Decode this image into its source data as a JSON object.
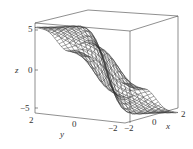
{
  "chart_data": {
    "type": "surface3d",
    "title": "",
    "xlabel": "x",
    "ylabel": "y",
    "zlabel": "z",
    "x_ticks": [
      "-2",
      "0",
      "2"
    ],
    "y_ticks": [
      "2",
      "0",
      "-2"
    ],
    "z_ticks": [
      "5",
      "0",
      "-5"
    ],
    "xlim": [
      -2,
      2
    ],
    "ylim": [
      -2,
      2
    ],
    "zlim": [
      -5,
      5
    ],
    "style": "wireframe mesh, black lines on white, bounding box"
  },
  "labels": {
    "z_axis": "z",
    "z_tick_top": "5",
    "z_tick_mid": "0",
    "z_tick_bot": "−5",
    "y_axis": "y",
    "y_tick_left": "2",
    "y_tick_mid": "0",
    "y_tick_right": "−2",
    "x_axis": "x",
    "x_tick_left": "−2",
    "x_tick_mid": "0",
    "x_tick_right": "2"
  },
  "colors": {
    "mesh": "#333333",
    "box": "#444444",
    "background": "#ffffff"
  }
}
